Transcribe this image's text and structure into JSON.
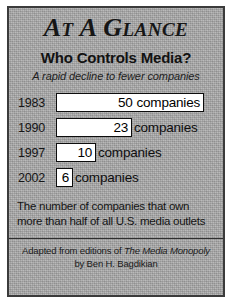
{
  "panel": {
    "title_text": "AT A GLANCE",
    "title_parts": [
      {
        "cap": "A",
        "rest": "T"
      },
      {
        "cap": "A",
        "rest": ""
      },
      {
        "cap": "G",
        "rest": "LANCE"
      }
    ],
    "headline": "Who Controls Media?",
    "subtitle": "A rapid decline to fewer companies",
    "caption_line1": "The number of companies that own",
    "caption_line2": "more than half of all U.S. media outlets",
    "source_line1_prefix": "Adapted from editions of",
    "source_book": "The Media Monopoly",
    "source_line2": "by Ben H. Bagdikian",
    "unit_label": "companies",
    "border_color": "#3b3b3b",
    "background_color": "#a9a9a9",
    "bar_fill_color": "#ffffff",
    "bar_border_color": "#0d0d0d",
    "text_color": "#141414"
  },
  "chart_data": {
    "type": "bar",
    "title": "Who Controls Media?",
    "subtitle": "A rapid decline to fewer companies",
    "orientation": "horizontal",
    "xlabel": "",
    "ylabel": "",
    "unit": "companies",
    "categories": [
      "1983",
      "1990",
      "1997",
      "2002"
    ],
    "values": [
      50,
      23,
      10,
      6
    ],
    "xlim": [
      0,
      50
    ],
    "grid": false,
    "legend": false,
    "annotation": "The number of companies that own more than half of all U.S. media outlets",
    "source": "Adapted from editions of The Media Monopoly by Ben H. Bagdikian",
    "rows": [
      {
        "year": "1983",
        "value": 50,
        "value_label": "50",
        "unit": "companies",
        "bar_width_px": 148,
        "unit_inside": true
      },
      {
        "year": "1990",
        "value": 23,
        "value_label": "23",
        "unit": "companies",
        "bar_width_px": 76,
        "unit_inside": false
      },
      {
        "year": "1997",
        "value": 10,
        "value_label": "10",
        "unit": "companies",
        "bar_width_px": 40,
        "unit_inside": false
      },
      {
        "year": "2002",
        "value": 6,
        "value_label": "6",
        "unit": "companies",
        "bar_width_px": 17,
        "unit_inside": false
      }
    ]
  }
}
